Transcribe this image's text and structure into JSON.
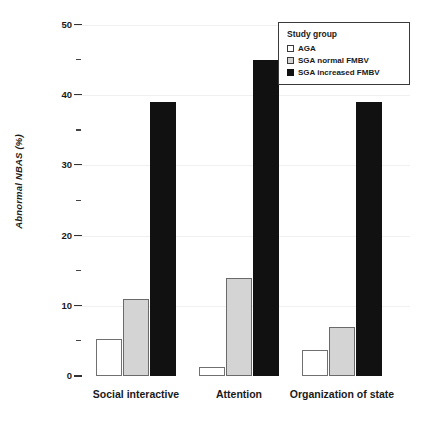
{
  "chart_data": {
    "type": "bar",
    "title": "",
    "xlabel": "",
    "ylabel": "Abnormal NBAS (%)",
    "ylim": [
      0,
      50
    ],
    "ytick_major": [
      "0",
      "10",
      "20",
      "30",
      "40",
      "50"
    ],
    "ytick_major_values": [
      0,
      10,
      20,
      30,
      40,
      50
    ],
    "ytick_minor_values": [
      5,
      15,
      25,
      35,
      45
    ],
    "grid": "faint horizontal gridlines at major ticks",
    "legend_position": "top-right",
    "categories": [
      "Social interactive",
      "Attention",
      "Organization of state"
    ],
    "series": [
      {
        "name": "AGA",
        "color": "#ffffff",
        "values": [
          5.3,
          1.3,
          3.7
        ]
      },
      {
        "name": "SGA normal FMBV",
        "color": "#d4d4d4",
        "values": [
          11,
          14,
          7
        ]
      },
      {
        "name": "SGA increased FMBV",
        "color": "#111111",
        "values": [
          39,
          45,
          39
        ]
      }
    ]
  },
  "legend": {
    "title": "Study group",
    "items": [
      {
        "label": "AGA",
        "swatch": "white"
      },
      {
        "label": "SGA normal FMBV",
        "swatch": "gray"
      },
      {
        "label": "SGA increased FMBV",
        "swatch": "black"
      }
    ]
  },
  "axis": {
    "y_title": "Abnormal NBAS (%)",
    "ticks": [
      "50",
      "45",
      "40",
      "35",
      "30",
      "25",
      "20",
      "15",
      "10",
      "5",
      "0"
    ]
  },
  "x_labels": [
    "Social interactive",
    "Attention",
    "Organization of state"
  ],
  "colors": {
    "aga": "#ffffff",
    "sga_normal": "#d4d4d4",
    "sga_increased": "#111111",
    "axis_text": "#1a1a1a",
    "bar_outline": "#6b6b6b"
  }
}
